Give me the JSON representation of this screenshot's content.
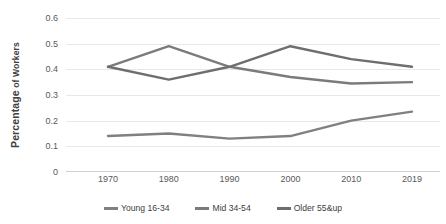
{
  "chart_data": {
    "type": "line",
    "title": "",
    "xlabel": "",
    "ylabel": "Percentage of Workers",
    "ylabel_bold_part": "Percentage",
    "ylabel_small_part": " of Workers",
    "categories": [
      "1970",
      "1980",
      "1990",
      "2000",
      "2010",
      "2019"
    ],
    "x": [
      1970,
      1980,
      1990,
      2000,
      2010,
      2019
    ],
    "ylim": [
      0,
      0.6
    ],
    "yticks": [
      "0",
      "0.1",
      "0.2",
      "0.3",
      "0.4",
      "0.5",
      "0.6"
    ],
    "ytick_values": [
      0,
      0.1,
      0.2,
      0.3,
      0.4,
      0.5,
      0.6
    ],
    "grid": true,
    "legend_position": "bottom",
    "series": [
      {
        "name": "Young 16-34",
        "color": "#808080",
        "values": [
          0.14,
          0.15,
          0.13,
          0.14,
          0.2,
          0.235
        ]
      },
      {
        "name": "Mid 34-54",
        "color": "#7b7b7b",
        "values": [
          0.41,
          0.49,
          0.41,
          0.37,
          0.345,
          0.35
        ]
      },
      {
        "name": "Older 55&up",
        "color": "#6e6e6e",
        "values": [
          0.41,
          0.36,
          0.41,
          0.49,
          0.44,
          0.41
        ]
      }
    ]
  }
}
